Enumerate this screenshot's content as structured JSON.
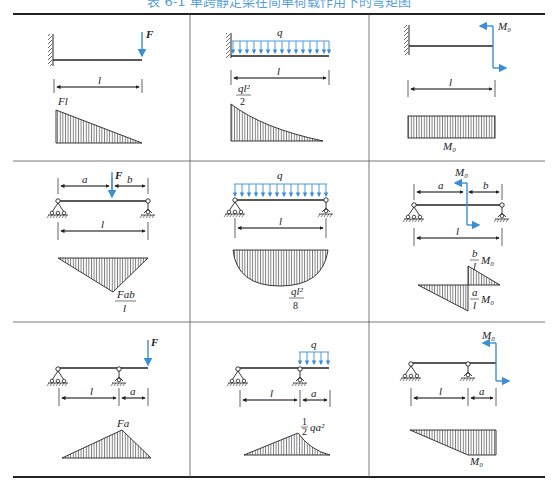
{
  "title": "表 6-1  单跨静定梁在简单荷载作用下的弯矩图",
  "colors": {
    "load": "#3a8fd6",
    "line": "#222222",
    "hatch": "#555555"
  },
  "table": {
    "rows": 3,
    "cols": 3,
    "cells": [
      {
        "id": "cantilever-point-load",
        "support": "fixed",
        "load": "F",
        "load_type": "point-load-end",
        "span_label": "l",
        "moment_label": "Fl",
        "moment_shape": "triangle"
      },
      {
        "id": "cantilever-uniform-load",
        "support": "fixed",
        "load": "q",
        "load_type": "uniform-load",
        "span_label": "l",
        "moment_label_num": "ql²",
        "moment_label_den": "2",
        "moment_shape": "parabola"
      },
      {
        "id": "cantilever-end-moment",
        "support": "fixed",
        "load": "M₀",
        "load_type": "couple-end",
        "span_label": "l",
        "moment_label": "M₀",
        "moment_shape": "rectangle"
      },
      {
        "id": "simple-point-load",
        "support": "simple",
        "load": "F",
        "load_type": "point-load-interior",
        "dims": [
          "a",
          "b"
        ],
        "span_label": "l",
        "moment_label_num": "Fab",
        "moment_label_den": "l",
        "moment_shape": "triangle"
      },
      {
        "id": "simple-uniform-load",
        "support": "simple",
        "load": "q",
        "load_type": "uniform-load",
        "span_label": "l",
        "moment_label_num": "ql²",
        "moment_label_den": "8",
        "moment_shape": "parabola"
      },
      {
        "id": "simple-interior-moment",
        "support": "simple",
        "load": "M₀",
        "load_type": "couple-interior",
        "dims": [
          "a",
          "b"
        ],
        "span_label": "l",
        "moment_label_top_num": "b",
        "moment_label_top_den": "l",
        "moment_label_top_suffix": "M₀",
        "moment_label_bot_num": "a",
        "moment_label_bot_den": "l",
        "moment_label_bot_suffix": "M₀",
        "moment_shape": "double-triangle"
      },
      {
        "id": "overhang-point-load",
        "support": "overhang",
        "load": "F",
        "load_type": "point-load-tip",
        "dims": [
          "l",
          "a"
        ],
        "moment_label": "Fa",
        "moment_shape": "triangle"
      },
      {
        "id": "overhang-uniform-load",
        "support": "overhang",
        "load": "q",
        "load_type": "uniform-load-overhang",
        "dims": [
          "l",
          "a"
        ],
        "moment_label_frac_num": "1",
        "moment_label_frac_den": "2",
        "moment_label_suffix": "qa²",
        "moment_shape": "triangle-parabola"
      },
      {
        "id": "overhang-end-moment",
        "support": "overhang",
        "load": "M₀",
        "load_type": "couple-tip",
        "dims": [
          "l",
          "a"
        ],
        "moment_label": "M₀",
        "moment_shape": "trapezoid"
      }
    ]
  }
}
